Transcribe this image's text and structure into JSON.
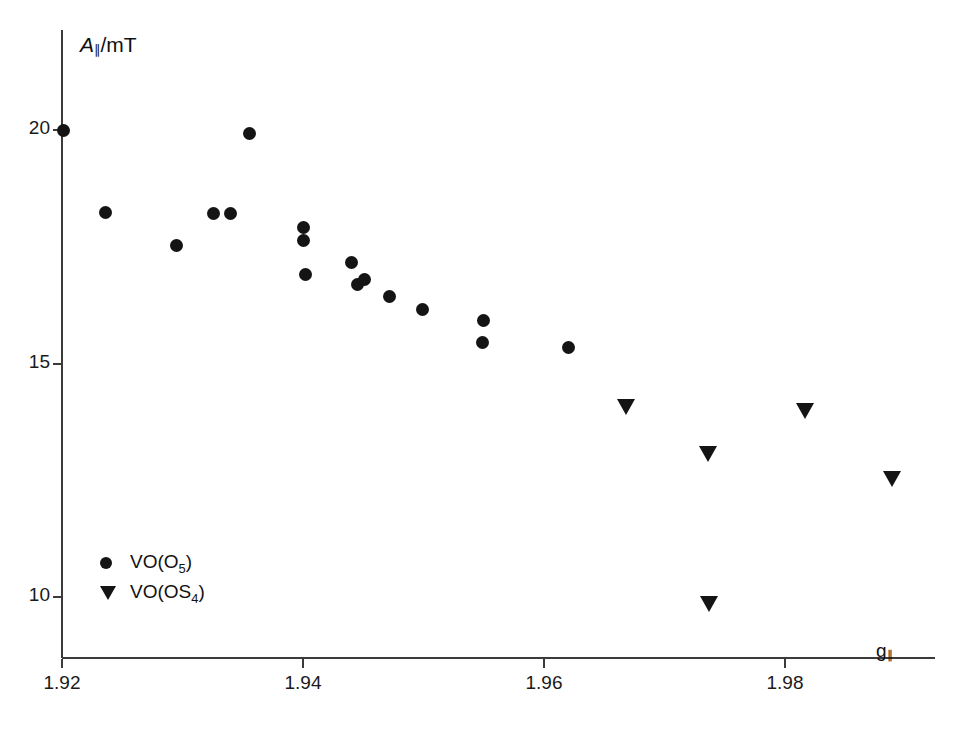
{
  "chart_data": {
    "type": "scatter",
    "title": "",
    "xlabel": "g∥",
    "ylabel": "A∥/mT",
    "xlim": [
      1.9195,
      1.9919
    ],
    "ylim": [
      9.3,
      20.9
    ],
    "grid": false,
    "legend_position": "lower-left",
    "xticks": [
      1.92,
      1.94,
      1.96,
      1.98
    ],
    "xtick_labels": [
      "1.92",
      "1.94",
      "1.96",
      "1.98"
    ],
    "yticks": [
      10,
      15,
      20
    ],
    "ytick_labels": [
      "10",
      "15",
      "20"
    ],
    "series": [
      {
        "name": "VO(O5)",
        "label": "VO(O₅)",
        "marker": "circle",
        "color": "#141414",
        "points": [
          {
            "x": 1.9201,
            "y": 20.0
          },
          {
            "x": 1.9236,
            "y": 18.23
          },
          {
            "x": 1.9295,
            "y": 17.52
          },
          {
            "x": 1.9326,
            "y": 18.21
          },
          {
            "x": 1.934,
            "y": 18.21
          },
          {
            "x": 1.9356,
            "y": 19.93
          },
          {
            "x": 1.94,
            "y": 17.92
          },
          {
            "x": 1.94,
            "y": 17.64
          },
          {
            "x": 1.9402,
            "y": 16.9
          },
          {
            "x": 1.944,
            "y": 17.16
          },
          {
            "x": 1.9445,
            "y": 16.69
          },
          {
            "x": 1.9451,
            "y": 16.8
          },
          {
            "x": 1.9472,
            "y": 16.43
          },
          {
            "x": 1.9499,
            "y": 16.15
          },
          {
            "x": 1.955,
            "y": 15.93
          },
          {
            "x": 1.9549,
            "y": 15.44
          },
          {
            "x": 1.962,
            "y": 15.35
          }
        ]
      },
      {
        "name": "VO(OS4)",
        "label": "VO(OS₄)",
        "marker": "triangle-down",
        "color": "#141414",
        "points": [
          {
            "x": 1.9668,
            "y": 14.07
          },
          {
            "x": 1.9736,
            "y": 13.07
          },
          {
            "x": 1.9737,
            "y": 9.86
          },
          {
            "x": 1.9817,
            "y": 13.98
          },
          {
            "x": 1.9889,
            "y": 12.52
          }
        ]
      }
    ]
  },
  "axes": {
    "y_title_main": "A",
    "y_title_rest": "/mT",
    "x_title_main": "g"
  },
  "legend": {
    "entries": [
      {
        "label": "VO(O",
        "sub": "5",
        "tail": ")"
      },
      {
        "label": "VO(OS",
        "sub": "4",
        "tail": ")"
      }
    ]
  }
}
